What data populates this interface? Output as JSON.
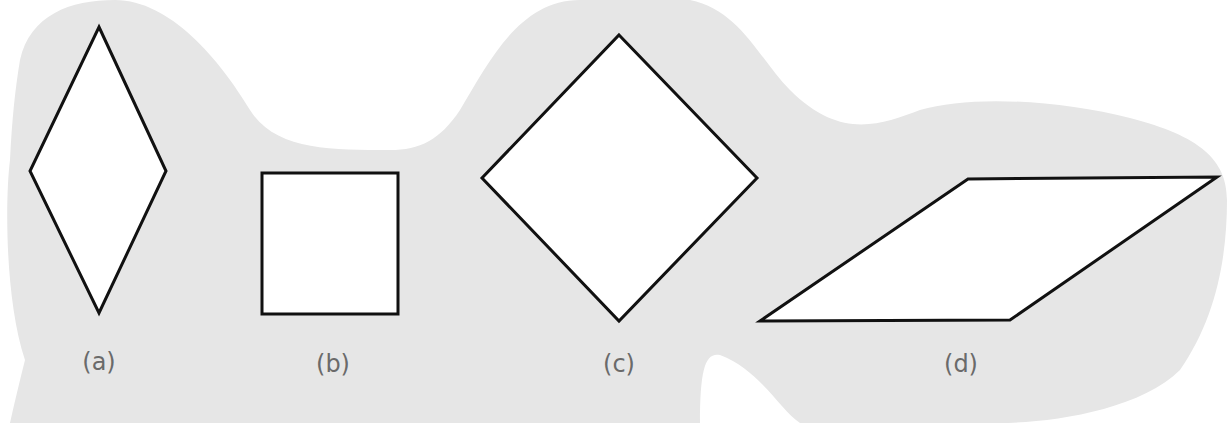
{
  "colors": {
    "background": "#ffffff",
    "blob": "#e6e6e6",
    "shape_fill": "#ffffff",
    "shape_stroke": "#111111",
    "label": "#6a6a6a"
  },
  "figures": [
    {
      "id": "a",
      "label": "(a)",
      "shape": "rhombus (tall)",
      "points": "99,27 166,171 99,313 30,171",
      "label_x": 99,
      "label_y": 348
    },
    {
      "id": "b",
      "label": "(b)",
      "shape": "square",
      "points": "262,173 398,173 398,314 262,314",
      "label_x": 333,
      "label_y": 350
    },
    {
      "id": "c",
      "label": "(c)",
      "shape": "square rotated 45°",
      "points": "619,35 757,178 619,321 482,178",
      "label_x": 619,
      "label_y": 350
    },
    {
      "id": "d",
      "label": "(d)",
      "shape": "rhombus (slanted)",
      "points": "968,179 1217,177 1010,320 760,321",
      "label_x": 961,
      "label_y": 350
    }
  ]
}
